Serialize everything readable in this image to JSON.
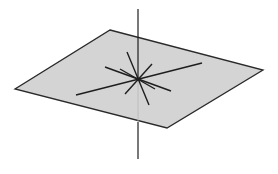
{
  "diagram": {
    "colors": {
      "background": "#ffffff",
      "plane_fill": "#d4d4d4",
      "plane_edge": "#2a2a2a",
      "line": "#1e1e1e",
      "hidden_line": "#b8b8b8"
    },
    "plane": {
      "points": "110,30 263,70 167,128 15,89"
    },
    "perpendicular": {
      "top": {
        "x1": 138,
        "y1": 9,
        "x2": 138,
        "y2": 79
      },
      "hidden": {
        "x1": 138,
        "y1": 79,
        "x2": 138,
        "y2": 122
      },
      "bottom": {
        "x1": 138,
        "y1": 122,
        "x2": 138,
        "y2": 159
      }
    },
    "foot_point": {
      "x": 138,
      "y": 79
    },
    "plane_lines": [
      {
        "x1": 76,
        "y1": 95,
        "x2": 202,
        "y2": 63
      },
      {
        "x1": 105,
        "y1": 67,
        "x2": 171,
        "y2": 91
      },
      {
        "x1": 127,
        "y1": 52,
        "x2": 149,
        "y2": 105
      },
      {
        "x1": 152,
        "y1": 64,
        "x2": 125,
        "y2": 94
      },
      {
        "x1": 120,
        "y1": 69,
        "x2": 155,
        "y2": 89
      }
    ]
  }
}
